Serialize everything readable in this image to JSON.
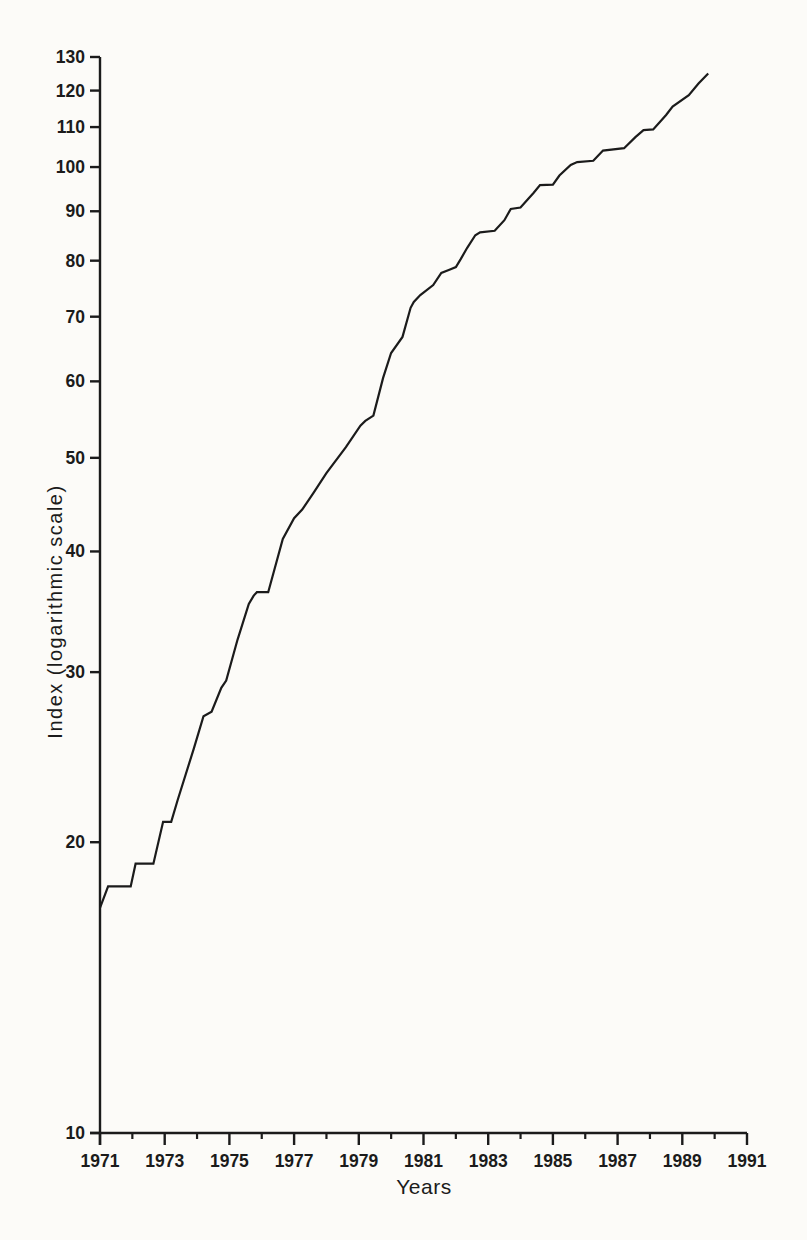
{
  "figure": {
    "background": "#fcfbf8",
    "ink_color": "#1b1b1b"
  },
  "chart_data": {
    "type": "line",
    "title": "",
    "xlabel": "Years",
    "ylabel": "Index (logarithmic scale)",
    "x_scale": "linear",
    "y_scale": "log",
    "xlim": [
      1971,
      1991
    ],
    "ylim": [
      10,
      130
    ],
    "grid": false,
    "legend": "none",
    "y_tick_values": [
      10,
      20,
      30,
      40,
      50,
      60,
      70,
      80,
      90,
      100,
      110,
      120,
      130
    ],
    "y_tick_labels": [
      "10",
      "20",
      "30",
      "40",
      "50",
      "60",
      "70",
      "80",
      "90",
      "100",
      "110",
      "120",
      "130"
    ],
    "x_major_tick_values": [
      1971,
      1973,
      1975,
      1977,
      1979,
      1981,
      1983,
      1985,
      1987,
      1989,
      1991
    ],
    "x_major_tick_labels": [
      "1971",
      "1973",
      "1975",
      "1977",
      "1979",
      "1981",
      "1983",
      "1985",
      "1987",
      "1989",
      "1991"
    ],
    "x_minor_tick_values": [
      1972,
      1974,
      1976,
      1978,
      1980,
      1982,
      1984,
      1986,
      1988,
      1990
    ],
    "series": [
      {
        "name": "Index",
        "points": [
          [
            1971.0,
            17.1
          ],
          [
            1971.25,
            18.0
          ],
          [
            1971.95,
            18.0
          ],
          [
            1972.1,
            19.0
          ],
          [
            1972.65,
            19.0
          ],
          [
            1972.95,
            21.0
          ],
          [
            1973.2,
            21.0
          ],
          [
            1973.4,
            22.1
          ],
          [
            1973.9,
            25.0
          ],
          [
            1974.2,
            27.0
          ],
          [
            1974.45,
            27.3
          ],
          [
            1974.75,
            28.9
          ],
          [
            1974.9,
            29.4
          ],
          [
            1975.25,
            32.4
          ],
          [
            1975.6,
            35.3
          ],
          [
            1975.75,
            36.0
          ],
          [
            1975.85,
            36.3
          ],
          [
            1976.2,
            36.3
          ],
          [
            1976.65,
            41.2
          ],
          [
            1977.0,
            43.3
          ],
          [
            1977.25,
            44.2
          ],
          [
            1977.6,
            46.0
          ],
          [
            1978.0,
            48.2
          ],
          [
            1978.6,
            51.3
          ],
          [
            1979.05,
            54.0
          ],
          [
            1979.2,
            54.6
          ],
          [
            1979.45,
            55.3
          ],
          [
            1979.75,
            60.5
          ],
          [
            1980.0,
            64.2
          ],
          [
            1980.35,
            66.7
          ],
          [
            1980.6,
            71.5
          ],
          [
            1980.7,
            72.5
          ],
          [
            1980.9,
            73.7
          ],
          [
            1981.3,
            75.5
          ],
          [
            1981.55,
            77.7
          ],
          [
            1981.8,
            78.3
          ],
          [
            1982.0,
            78.8
          ],
          [
            1982.15,
            80.3
          ],
          [
            1982.35,
            82.5
          ],
          [
            1982.6,
            85.0
          ],
          [
            1982.75,
            85.6
          ],
          [
            1983.2,
            85.9
          ],
          [
            1983.5,
            88.1
          ],
          [
            1983.7,
            90.5
          ],
          [
            1984.0,
            90.8
          ],
          [
            1984.15,
            92.0
          ],
          [
            1984.4,
            94.0
          ],
          [
            1984.6,
            95.8
          ],
          [
            1985.0,
            95.9
          ],
          [
            1985.2,
            98.0
          ],
          [
            1985.55,
            100.5
          ],
          [
            1985.75,
            101.2
          ],
          [
            1986.25,
            101.5
          ],
          [
            1986.55,
            104.0
          ],
          [
            1987.2,
            104.6
          ],
          [
            1987.55,
            107.4
          ],
          [
            1987.8,
            109.2
          ],
          [
            1988.1,
            109.4
          ],
          [
            1988.5,
            113.2
          ],
          [
            1988.7,
            115.5
          ],
          [
            1989.2,
            118.7
          ],
          [
            1989.5,
            122.0
          ],
          [
            1989.8,
            125.0
          ]
        ]
      }
    ]
  }
}
